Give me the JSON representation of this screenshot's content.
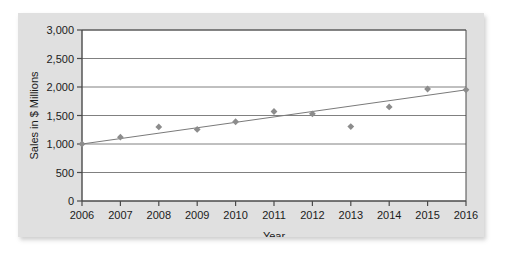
{
  "figure": {
    "panel_background": "#e0e0e0",
    "plot_background": "#ffffff",
    "border_color": "#4a4a4a",
    "gridline_color": "#808080",
    "marker_color": "#8c8c8c",
    "trendline_color": "#7a7a7a",
    "text_color": "#1b1b1b"
  },
  "chart_data": {
    "type": "scatter",
    "title": "",
    "xlabel": "Year",
    "ylabel": "Sales in $ Millions",
    "xlim": [
      2006,
      2016
    ],
    "ylim": [
      0,
      3000
    ],
    "grid": true,
    "legend": "none",
    "x_tick_labels": [
      "2006",
      "2007",
      "2008",
      "2009",
      "2010",
      "2011",
      "2012",
      "2013",
      "2014",
      "2015",
      "2016"
    ],
    "y_tick_labels": [
      "0",
      "500",
      "1,000",
      "1,500",
      "2,000",
      "2,500",
      "3,000"
    ],
    "y_ticks": [
      0,
      500,
      1000,
      1500,
      2000,
      2500,
      3000
    ],
    "x": [
      2006,
      2007,
      2008,
      2009,
      2010,
      2011,
      2012,
      2013,
      2014,
      2015,
      2016
    ],
    "values": [
      1000,
      1120,
      1300,
      1255,
      1390,
      1570,
      1530,
      1305,
      1650,
      1965,
      1950
    ],
    "series": [
      {
        "name": "Sales",
        "marker": "diamond",
        "values": [
          1000,
          1120,
          1300,
          1255,
          1390,
          1570,
          1530,
          1305,
          1650,
          1965,
          1950
        ]
      }
    ],
    "trendline": {
      "name": "Linear trend",
      "x_start": 2006,
      "y_start": 1000,
      "x_end": 2016,
      "y_end": 1950
    }
  }
}
